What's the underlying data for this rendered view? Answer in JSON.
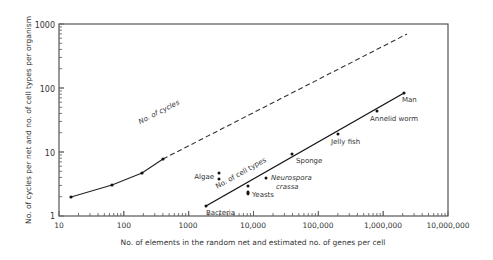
{
  "chart_data": {
    "type": "line",
    "title": "",
    "xlabel": "No. of elements in the random net and estimated no. of genes per cell",
    "ylabel": "No. of cycles per net and no. of cell types per organism",
    "xscale": "log",
    "yscale": "log",
    "xlim": [
      10,
      10000000
    ],
    "ylim": [
      1,
      1000
    ],
    "grid": false,
    "legend": "none (inline line labels)",
    "x_ticks": [
      "10",
      "100",
      "1000",
      "10,000",
      "100,000",
      "1,000,000",
      "10,000,000"
    ],
    "y_ticks": [
      "1",
      "10",
      "100",
      "1000"
    ],
    "series": [
      {
        "name": "No. of cycles",
        "style": "solid segment through data, then dashed extrapolation",
        "points": [
          {
            "x": 15,
            "y": 2
          },
          {
            "x": 64,
            "y": 3.8
          },
          {
            "x": 190,
            "y": 5.8
          },
          {
            "x": 400,
            "y": 9.5
          }
        ],
        "extrapolation_end": {
          "x": 2200000,
          "y": 700
        }
      },
      {
        "name": "No. of cell types",
        "style": "solid",
        "points": [
          {
            "x": 2000,
            "y": 1.8,
            "label": "Bacteria"
          },
          {
            "x": 8000,
            "y": 2.5,
            "label": "Yeasts"
          },
          {
            "x": 8000,
            "y": 2.8,
            "label": ""
          },
          {
            "x": 8000,
            "y": 3.6,
            "label": ""
          },
          {
            "x": 3000,
            "y": 4.5,
            "label": "Algae"
          },
          {
            "x": 3000,
            "y": 5.5,
            "label": ""
          },
          {
            "x": 15000,
            "y": 4.7,
            "label": "Neurospora crassa"
          },
          {
            "x": 40000,
            "y": 11,
            "label": "Sponge"
          },
          {
            "x": 200000,
            "y": 22,
            "label": "Jelly fish"
          },
          {
            "x": 800000,
            "y": 50,
            "label": "Annelid worm"
          },
          {
            "x": 2000000,
            "y": 90,
            "label": "Man"
          }
        ],
        "fit_line": [
          {
            "x": 2000,
            "y": 1.8
          },
          {
            "x": 2000000,
            "y": 90
          }
        ]
      }
    ],
    "annotations": [
      "No. of cycles",
      "No. of cell types",
      "Algae",
      "Neurospora crassa",
      "Yeasts",
      "Bacteria",
      "Sponge",
      "Jelly fish",
      "Annelid worm",
      "Man"
    ]
  },
  "labels": {
    "xlabel": "No. of elements in the random net and estimated no. of genes per cell",
    "ylabel": "No. of cycles per net and no. of cell types per organism",
    "x_ticks": [
      "10",
      "100",
      "1000",
      "10,000",
      "100,000",
      "1,000,000",
      "10,000,000"
    ],
    "y_ticks": [
      "1",
      "10",
      "100",
      "1000"
    ],
    "cycles_line": "No. of cycles",
    "celltypes_line": "No. of cell types",
    "algae": "Algae",
    "neurospora_1": "Neurospora",
    "neurospora_2": "crassa",
    "yeasts": "Yeasts",
    "bacteria": "Bacteria",
    "sponge": "Sponge",
    "jellyfish": "Jelly fish",
    "annelid": "Annelid worm",
    "man": "Man"
  }
}
